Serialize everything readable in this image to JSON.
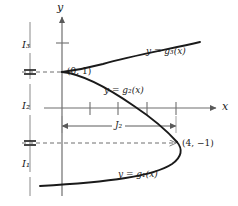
{
  "figure": {
    "type": "cartesian-diagram",
    "axes": {
      "y_axis_label": "y",
      "x_axis_label": "x"
    },
    "points": [
      {
        "id": "p-0-1",
        "label": "(0, 1)",
        "x": 0,
        "y": 1
      },
      {
        "id": "p-4-neg1",
        "label": "(4, −1)",
        "x": 4,
        "y": -1
      }
    ],
    "curves": [
      {
        "id": "g3",
        "label": "y = g₃(x)",
        "branch": "upper"
      },
      {
        "id": "g2",
        "label": "y = g₂(x)",
        "branch": "middle"
      },
      {
        "id": "g1",
        "label": "y = g₁(x)",
        "branch": "lower"
      }
    ],
    "intervals": [
      {
        "id": "I3",
        "label": "I₃",
        "position": "top"
      },
      {
        "id": "I2",
        "label": "I₂",
        "position": "middle"
      },
      {
        "id": "I1",
        "label": "I₁",
        "position": "bottom"
      }
    ],
    "segments": [
      {
        "id": "J2",
        "label": "J₂",
        "from_x": 0,
        "to_x": 4
      }
    ],
    "x_ticks": [
      0,
      1,
      2,
      3,
      4
    ],
    "colors": {
      "curve": "#1a1a1a",
      "axis": "#6f6f6f",
      "dashed": "#6f6f6f",
      "text": "#1a1a1a"
    }
  }
}
